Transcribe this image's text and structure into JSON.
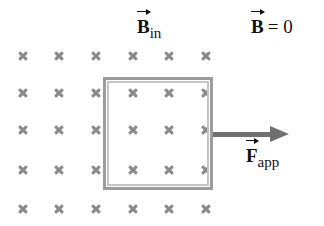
{
  "diagram": {
    "field_region": {
      "symbol": "×",
      "meaning": "magnetic field directed into the page",
      "columns_x": [
        23,
        59,
        96,
        133,
        169,
        206
      ],
      "rows_y": [
        56,
        93,
        130,
        170,
        209
      ],
      "color": "#8a8a8a"
    },
    "labels": {
      "b_in": {
        "base": "B",
        "subscript": "in"
      },
      "b_zero": {
        "base": "B",
        "equation": "= 0"
      },
      "f_app": {
        "base": "F",
        "subscript": "app"
      }
    },
    "loop": {
      "shape": "square conducting loop",
      "color": "#9c9c9c"
    },
    "arrow": {
      "direction": "right",
      "color": "#6f6f6f"
    }
  }
}
